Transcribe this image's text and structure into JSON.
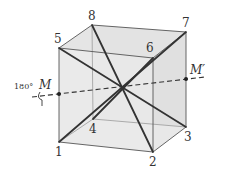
{
  "figure": {
    "vertices": {
      "1": {
        "label": "1",
        "x": 59,
        "y": 142
      },
      "2": {
        "label": "2",
        "x": 153,
        "y": 152
      },
      "3": {
        "label": "3",
        "x": 186,
        "y": 127
      },
      "4": {
        "label": "4",
        "x": 93,
        "y": 119
      },
      "5": {
        "label": "5",
        "x": 59,
        "y": 48
      },
      "6": {
        "label": "6",
        "x": 153,
        "y": 58
      },
      "7": {
        "label": "7",
        "x": 186,
        "y": 32
      },
      "8": {
        "label": "8",
        "x": 92,
        "y": 25
      }
    },
    "axis": {
      "start_label": "M",
      "end_label": "M′",
      "rotation_label": "180°"
    },
    "colors": {
      "face_fill": "#e6e6e6",
      "edge": "#555555",
      "diagonal": "#333333",
      "axis": "#333333"
    }
  }
}
